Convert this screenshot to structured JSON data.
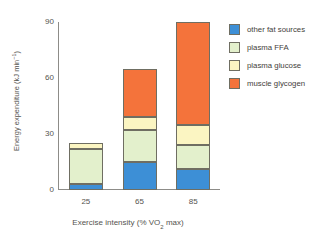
{
  "chart_data": {
    "type": "bar",
    "subtype": "stacked",
    "title": "",
    "xlabel": "Exercise intensity (% VO2 max)",
    "xlabel_parts": {
      "pre": "Exercise intensity (% VO",
      "sub": "2",
      "post": " max)"
    },
    "ylabel": "Energy expenditure (kJ min-1)",
    "ylabel_parts": {
      "pre": "Energy expenditure (kJ min",
      "sup": "−1",
      "post": ")"
    },
    "categories": [
      "25",
      "65",
      "85"
    ],
    "ylim": [
      0,
      90
    ],
    "yticks": [
      0,
      30,
      60,
      90
    ],
    "ytick_labels": [
      "0",
      "30",
      "60",
      "90"
    ],
    "grid": false,
    "legend_position": "right",
    "series": [
      {
        "name": "other fat sources",
        "color": "#3d8fd6",
        "values": [
          3,
          15,
          11
        ]
      },
      {
        "name": "plasma FFA",
        "color": "#e3f0cc",
        "values": [
          19,
          17,
          13
        ]
      },
      {
        "name": "plasma glucose",
        "color": "#fbf5c2",
        "values": [
          3,
          7,
          11
        ]
      },
      {
        "name": "muscle glycogen",
        "color": "#f4733b",
        "values": [
          0,
          26,
          55
        ]
      }
    ],
    "totals": [
      25,
      65,
      90
    ],
    "annotations": []
  },
  "legend": {
    "items": [
      {
        "label": "other fat sources",
        "color": "#3d8fd6"
      },
      {
        "label": "plasma FFA",
        "color": "#e3f0cc"
      },
      {
        "label": "plasma glucose",
        "color": "#fbf5c2"
      },
      {
        "label": "muscle glycogen",
        "color": "#f4733b"
      }
    ]
  },
  "colors": {
    "axis": "#8d8c88",
    "text": "#55544f",
    "segment_border": "#6f6e62",
    "background": "#ffffff"
  }
}
